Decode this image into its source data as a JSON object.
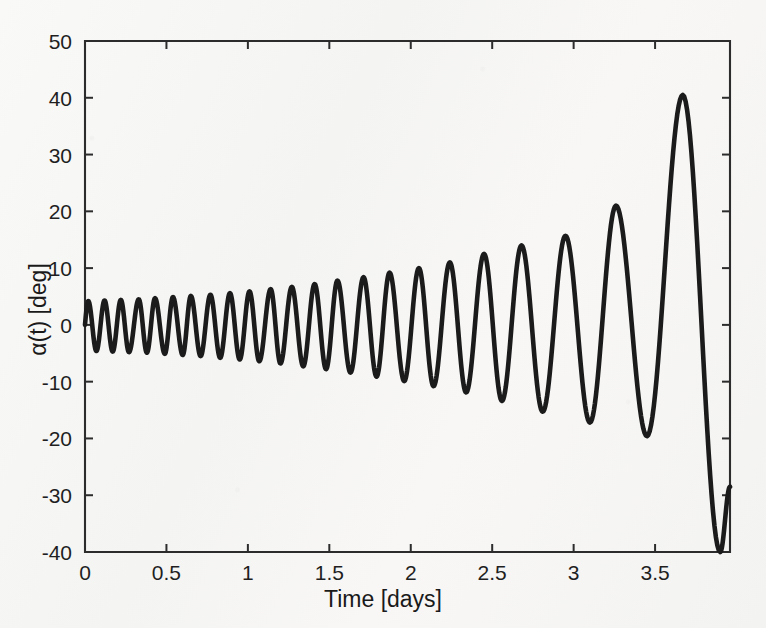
{
  "chart_data": {
    "type": "line",
    "title": "",
    "xlabel": "Time [days]",
    "ylabel": "α(t) [deg]",
    "xlim": [
      0,
      3.96
    ],
    "ylim": [
      -40,
      50
    ],
    "xticks": [
      "0",
      "0.5",
      "1",
      "1.5",
      "2",
      "2.5",
      "3",
      "3.5"
    ],
    "xtick_values": [
      0,
      0.5,
      1,
      1.5,
      2,
      2.5,
      3,
      3.5
    ],
    "yticks": [
      "50",
      "40",
      "30",
      "20",
      "10",
      "0",
      "-10",
      "-20",
      "-30",
      "-40"
    ],
    "ytick_values": [
      50,
      40,
      30,
      20,
      10,
      0,
      -10,
      -20,
      -30,
      -40
    ],
    "grid": false,
    "legend": null,
    "line_color": "#1b1b1b",
    "background_color": "#f7f7f6",
    "series": [
      {
        "name": "alpha(t)",
        "envelope_note": "amplitude grows roughly exponentially; period lengthens with amplitude",
        "extrema_t": [
          0.02,
          0.07,
          0.12,
          0.17,
          0.22,
          0.27,
          0.33,
          0.38,
          0.43,
          0.49,
          0.54,
          0.6,
          0.65,
          0.71,
          0.77,
          0.83,
          0.89,
          0.95,
          1.01,
          1.07,
          1.14,
          1.2,
          1.27,
          1.34,
          1.41,
          1.48,
          1.55,
          1.63,
          1.71,
          1.79,
          1.87,
          1.96,
          2.05,
          2.14,
          2.24,
          2.34,
          2.45,
          2.56,
          2.68,
          2.81,
          2.95,
          3.1,
          3.26,
          3.45,
          3.67,
          3.9,
          3.96
        ],
        "extrema_alpha": [
          4.2,
          -4.6,
          4.3,
          -4.7,
          4.4,
          -4.8,
          4.5,
          -4.9,
          4.7,
          -5.1,
          4.9,
          -5.3,
          5.1,
          -5.5,
          5.3,
          -5.8,
          5.6,
          -6.1,
          5.9,
          -6.4,
          6.3,
          -6.8,
          6.7,
          -7.3,
          7.2,
          -7.8,
          7.8,
          -8.4,
          8.4,
          -9.1,
          9.2,
          -9.9,
          10.0,
          -10.8,
          11.0,
          -11.9,
          12.5,
          -13.4,
          14.0,
          -15.3,
          15.7,
          -17.2,
          21.0,
          -19.6,
          40.5,
          -40.0,
          -28.5
        ]
      }
    ]
  },
  "axes": {
    "plot_left_px": 85,
    "plot_right_px": 730,
    "plot_top_px": 41,
    "plot_bottom_px": 552
  }
}
